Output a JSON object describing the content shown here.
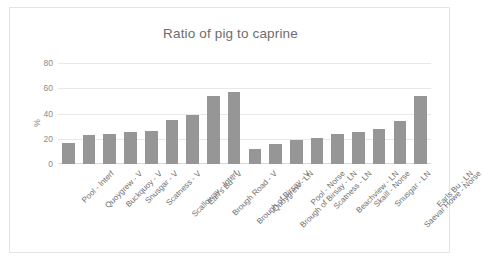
{
  "chart_data": {
    "type": "bar",
    "title": "Ratio of pig to caprine",
    "xlabel": "",
    "ylabel": "%",
    "ylim": [
      0,
      80
    ],
    "yticks": [
      0,
      20,
      40,
      60,
      80
    ],
    "grid": true,
    "legend": false,
    "series_color": "#969696",
    "categories": [
      "Pool - Interf",
      "Quoygrew - V",
      "Buckquoy - V",
      "Snusgar - V",
      "Scatness - V",
      "Scalloway - Interf",
      "Earl's Bu - V",
      "Brough Road - V",
      "Brough of Birsay - V",
      "Quoygrew - LN",
      "Brough of Birsay - LN",
      "Pool - Norse",
      "Scatness - LN",
      "Beachview - LN",
      "Skaill - Norse",
      "Snusgar - LN",
      "Saevar Howe - Norse",
      "Earls Bu - LN"
    ],
    "values": [
      17,
      23,
      24,
      25,
      26,
      35,
      39,
      54,
      57,
      12,
      16,
      19,
      21,
      24,
      25,
      28,
      34,
      54
    ]
  }
}
